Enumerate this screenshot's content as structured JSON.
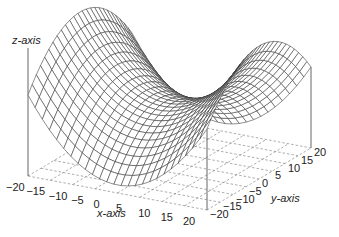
{
  "chart_data": {
    "type": "surface",
    "subtype": "3d-wireframe-saddle",
    "title": "",
    "xlabel": "x-axis",
    "ylabel": "y-axis",
    "zlabel": "z-axis",
    "xlim": [
      -20,
      20
    ],
    "ylim": [
      -20,
      20
    ],
    "x_ticks": [
      -20,
      -15,
      -10,
      -5,
      0,
      5,
      10,
      15,
      20
    ],
    "y_ticks": [
      -20,
      -15,
      -10,
      -5,
      0,
      5,
      10,
      15,
      20
    ],
    "x_tick_labels": [
      "−20",
      "−15",
      "−10",
      "−5",
      "0",
      "5",
      "10",
      "15",
      "20"
    ],
    "y_tick_labels": [
      "−20",
      "−15",
      "−10",
      "−5",
      "0",
      "5",
      "10",
      "15",
      "20"
    ],
    "function_shape": "saddle: high at x=±20,y=0 ridge along x, dipping toward y=±20 edges; lowest at center",
    "mesh_resolution": 25,
    "floor_grid": "dashed",
    "line_color": "#333333",
    "floor_color": "#8a8a8a",
    "background": "#ffffff"
  }
}
